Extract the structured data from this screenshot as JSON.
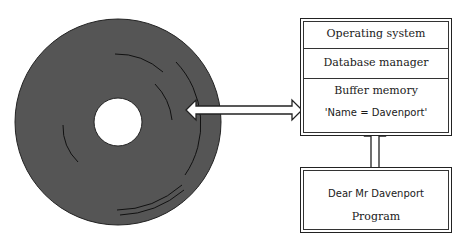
{
  "diagram": {
    "disk": {
      "label": "disk",
      "color": "#555555"
    },
    "memory_box": {
      "rows": [
        "Operating system",
        "Database manager",
        "Buffer memory"
      ],
      "buffer_content": "'Name = Davenport'"
    },
    "program_box": {
      "output_text": "Dear Mr Davenport",
      "label": "Program"
    },
    "arrows": [
      {
        "from": "disk",
        "to": "buffer-memory",
        "direction": "bidirectional"
      },
      {
        "from": "buffer-memory",
        "to": "program",
        "direction": "bidirectional"
      }
    ]
  }
}
